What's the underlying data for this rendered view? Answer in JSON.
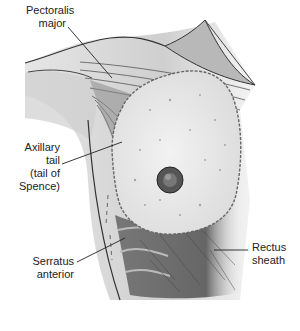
{
  "labels": {
    "pectoralis_major": [
      "Pectoralis",
      "major"
    ],
    "axillary_tail": [
      "Axillary",
      "tail",
      "(tail of",
      "Spence)"
    ],
    "serratus_anterior": [
      "Serratus",
      "anterior"
    ],
    "rectus_sheath": [
      "Rectus",
      "sheath"
    ]
  },
  "colors": {
    "line": "#222222",
    "muscle_dark": "#6a6a6a",
    "muscle_mid": "#9a9a9a",
    "skin_light": "#d8d8d8",
    "breast_tissue": "#ececec",
    "nipple": "#4a4a4a"
  }
}
